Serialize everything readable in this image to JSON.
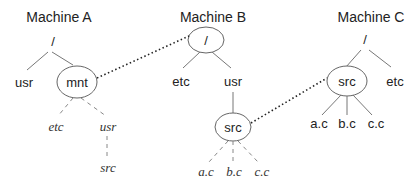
{
  "machines": [
    {
      "title": "Machine A",
      "root": "/",
      "children": [
        "usr",
        "mnt"
      ],
      "mounted_children": [
        "etc",
        "usr"
      ],
      "mounted_grandchild": "src"
    },
    {
      "title": "Machine B",
      "root": "/",
      "children": [
        "etc",
        "usr"
      ],
      "usr_child": "src",
      "src_children": [
        "a.c",
        "b.c",
        "c.c"
      ]
    },
    {
      "title": "Machine C",
      "root": "/",
      "children": [
        "src",
        "etc"
      ],
      "src_children": [
        "a.c",
        "b.c",
        "c.c"
      ]
    }
  ],
  "mounts": [
    {
      "from": "Machine A: mnt",
      "to": "Machine B: /"
    },
    {
      "from": "Machine B: src",
      "to": "Machine C: src"
    }
  ],
  "colors": {
    "text": "#222222",
    "edge": "#777777",
    "mount_link": "#222222"
  }
}
